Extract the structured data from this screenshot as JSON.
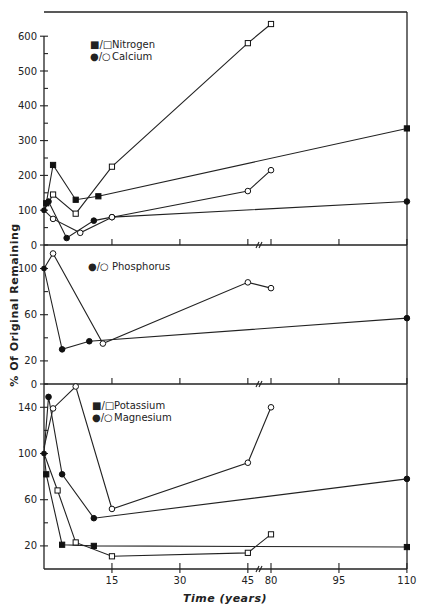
{
  "chart_data": [
    {
      "type": "line",
      "panel": "top",
      "title": "",
      "xlabel": "Time (years)",
      "ylabel": "% Of Original Remaining",
      "ylim": [
        0,
        650
      ],
      "yticks": [
        0,
        100,
        200,
        300,
        400,
        500,
        600
      ],
      "legend": [
        "■/□ Nitrogen",
        "●/○ Calcium"
      ],
      "series": [
        {
          "name": "Nitrogen (filled)",
          "marker": "filled-square",
          "x": [
            0,
            0.5,
            2,
            7,
            12,
            110
          ],
          "y": [
            100,
            120,
            230,
            130,
            140,
            335
          ]
        },
        {
          "name": "Nitrogen (open)",
          "marker": "open-square",
          "x": [
            0,
            2,
            7,
            15,
            45,
            80
          ],
          "y": [
            100,
            145,
            90,
            225,
            580,
            635
          ]
        },
        {
          "name": "Calcium (filled)",
          "marker": "filled-circle",
          "x": [
            0,
            1,
            5,
            11,
            15,
            110
          ],
          "y": [
            100,
            125,
            20,
            70,
            80,
            125
          ]
        },
        {
          "name": "Calcium (open)",
          "marker": "open-circle",
          "x": [
            0,
            2,
            8,
            15,
            45,
            80
          ],
          "y": [
            100,
            75,
            35,
            80,
            155,
            215
          ]
        }
      ]
    },
    {
      "type": "line",
      "panel": "middle",
      "ylim": [
        0,
        120
      ],
      "yticks": [
        0,
        20,
        60,
        100
      ],
      "legend": [
        "●/○ Phosphorus"
      ],
      "series": [
        {
          "name": "Phosphorus (filled)",
          "marker": "filled-circle",
          "x": [
            0,
            4,
            10,
            110
          ],
          "y": [
            100,
            30,
            37,
            57
          ]
        },
        {
          "name": "Phosphorus (open)",
          "marker": "open-circle",
          "x": [
            0,
            2,
            13,
            45,
            80
          ],
          "y": [
            100,
            113,
            35,
            88,
            83
          ]
        }
      ]
    },
    {
      "type": "line",
      "panel": "bottom",
      "ylim": [
        0,
        160
      ],
      "yticks": [
        20,
        60,
        100,
        140
      ],
      "legend": [
        "■/□ Potassium",
        "●/○ Magnesium"
      ],
      "xticks": [
        "15",
        "30",
        "45",
        "80",
        "95",
        "110"
      ],
      "series": [
        {
          "name": "Potassium (filled)",
          "marker": "filled-square",
          "x": [
            0,
            0.5,
            4,
            11,
            110
          ],
          "y": [
            100,
            82,
            21,
            20,
            19
          ]
        },
        {
          "name": "Potassium (open)",
          "marker": "open-square",
          "x": [
            0,
            3,
            7,
            15,
            45,
            80
          ],
          "y": [
            100,
            68,
            23,
            11,
            14,
            30
          ]
        },
        {
          "name": "Magnesium (filled)",
          "marker": "filled-circle",
          "x": [
            0,
            1,
            4,
            11,
            110
          ],
          "y": [
            100,
            149,
            82,
            44,
            78
          ]
        },
        {
          "name": "Magnesium (open)",
          "marker": "open-circle",
          "x": [
            0,
            2,
            7,
            15,
            45,
            80
          ],
          "y": [
            105,
            139,
            158,
            52,
            92,
            140
          ]
        }
      ]
    }
  ],
  "labels": {
    "ylabel": "% Of Original Remaining",
    "xlabel": "Time (years)",
    "legend_top_1_sym": "■/□",
    "legend_top_1": "Nitrogen",
    "legend_top_2_sym": "●/○",
    "legend_top_2": "Calcium",
    "legend_mid_1_sym": "●/○",
    "legend_mid_1": "Phosphorus",
    "legend_bot_1_sym": "■/□",
    "legend_bot_1": "Potassium",
    "legend_bot_2_sym": "●/○",
    "legend_bot_2": "Magnesium",
    "top_yticks": [
      "0",
      "100",
      "200",
      "300",
      "400",
      "500",
      "600"
    ],
    "mid_yticks": [
      "0",
      "20",
      "60",
      "100"
    ],
    "bot_yticks": [
      "20",
      "60",
      "100",
      "140"
    ],
    "xticks": [
      "15",
      "30",
      "45",
      "80",
      "95",
      "110"
    ],
    "break_mark": "//"
  }
}
